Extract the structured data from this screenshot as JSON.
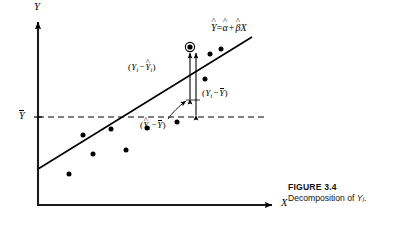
{
  "figure": {
    "caption_title": "FIGURE 3.4",
    "caption_text_prefix": "Decomposition of ",
    "caption_var": "Y",
    "caption_sub": "i",
    "caption_suffix": ".",
    "background_color": "#ffffff",
    "ink_color": "#000000"
  },
  "axes": {
    "y_label": "Y",
    "x_label": "X",
    "y_mean_tick_label": "Y",
    "y_mean_tick_accent": "bar",
    "origin_px": {
      "x": 38,
      "y": 205
    },
    "y_axis_top_px": 16,
    "x_axis_right_px": 278,
    "mean_line_y_px": 117,
    "mean_line_right_px": 266,
    "mean_line_style": "dashed",
    "arrowheads": [
      "y-up",
      "x-right"
    ]
  },
  "regression": {
    "equation_yhat": "Y",
    "equation_eq": "=",
    "equation_alpha": "α",
    "equation_plus": "+",
    "equation_beta": "β",
    "equation_x": "X",
    "line_start_px": {
      "x": 38,
      "y": 169
    },
    "line_end_px": {
      "x": 252,
      "y": 37
    },
    "line_color": "#000000"
  },
  "annotations": [
    {
      "id": "residual",
      "open": "(",
      "var1": "Y",
      "sub1": "i",
      "minus": "−",
      "var2": "Y",
      "sub2": "i",
      "accent2": "hat",
      "close": ")",
      "meaning": "residual",
      "arrow_x_px": 190,
      "arrow_top_px": 49,
      "arrow_bottom_px": 100
    },
    {
      "id": "total",
      "open": "(",
      "var1": "Y",
      "sub1": "i",
      "minus": "−",
      "var2": "Y",
      "accent2": "bar",
      "close": ")",
      "meaning": "total-deviation",
      "arrow_x_px": 196,
      "arrow_top_px": 49,
      "arrow_bottom_px": 116
    },
    {
      "id": "explained",
      "open": "(",
      "var1": "Y",
      "sub1": "i",
      "accent1": "hat",
      "minus": "−",
      "var2": "Y",
      "accent2": "bar",
      "close": ")",
      "meaning": "explained-deviation",
      "leader_from_px": {
        "x": 170,
        "y": 118
      },
      "leader_to_px": {
        "x": 186,
        "y": 101
      }
    }
  ],
  "scatter": {
    "point_color": "#000000",
    "point_radius_px": 2.5,
    "highlight": {
      "label": "Y-i-observed",
      "x_px": 190,
      "y_px": 47,
      "ring_radius_px": 4.6,
      "ring": true
    },
    "points": [
      {
        "x_px": 69,
        "y_px": 174
      },
      {
        "x_px": 93,
        "y_px": 154
      },
      {
        "x_px": 83,
        "y_px": 135
      },
      {
        "x_px": 126,
        "y_px": 150
      },
      {
        "x_px": 111,
        "y_px": 129
      },
      {
        "x_px": 147,
        "y_px": 128
      },
      {
        "x_px": 177,
        "y_px": 122
      },
      {
        "x_px": 210,
        "y_px": 54
      },
      {
        "x_px": 221,
        "y_px": 49
      },
      {
        "x_px": 205,
        "y_px": 79
      }
    ]
  }
}
